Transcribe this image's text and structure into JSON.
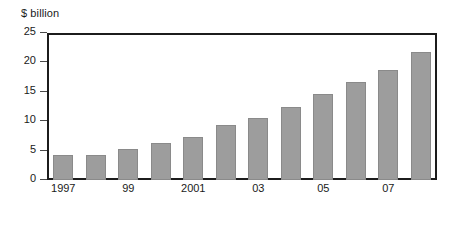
{
  "chart_data": {
    "type": "bar",
    "title": "",
    "subtitle": "",
    "xlabel": "",
    "ylabel": "$ billion",
    "ylim": [
      0,
      25
    ],
    "ytick_values": [
      0,
      5,
      10,
      15,
      20,
      25
    ],
    "ytick_labels": [
      "0",
      "5",
      "10",
      "15",
      "20",
      "25"
    ],
    "grid": false,
    "legend": null,
    "categories": [
      "1997",
      "1998",
      "1999",
      "2000",
      "2001",
      "2002",
      "2003",
      "2004",
      "2005",
      "2006",
      "2007",
      "2008"
    ],
    "xtick_labels": [
      "1997",
      "",
      "99",
      "",
      "2001",
      "",
      "03",
      "",
      "05",
      "",
      "07",
      ""
    ],
    "values": [
      4.2,
      4.2,
      5.2,
      6.3,
      7.4,
      9.4,
      10.5,
      12.5,
      14.7,
      16.7,
      18.7,
      21.8
    ],
    "bar_color": "#9d9d9d",
    "bar_edge_color": "#8a8a8a",
    "axis_color": "#1c1c1c",
    "text_color": "#1a1a1a",
    "background_color": "#ffffff"
  }
}
